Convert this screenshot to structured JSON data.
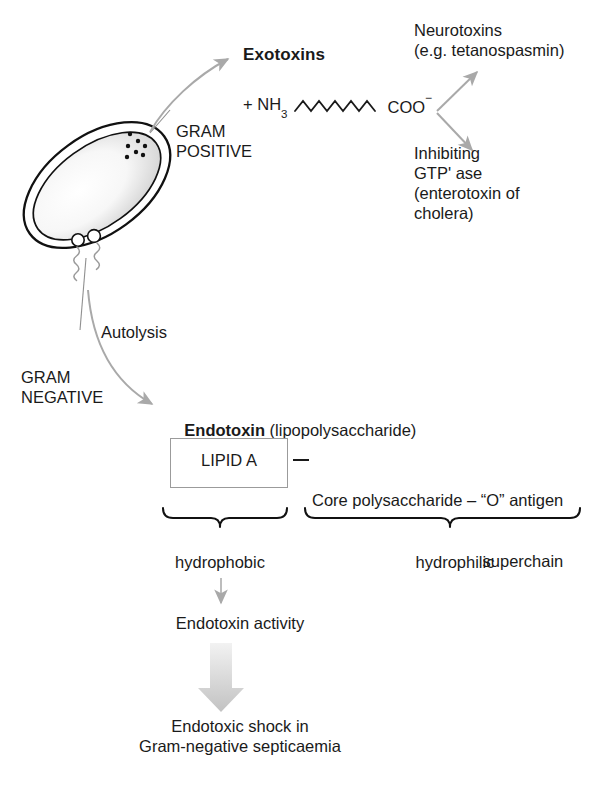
{
  "diagram": {
    "colors": {
      "arrow_gray": "#a9a9a9",
      "block_arrow_gray": "#cfcfcf",
      "outline_black": "#111111",
      "box_border": "#9b9b9b",
      "text": "#1a1a1a",
      "background": "#ffffff"
    },
    "cell": {
      "name": "bacterium",
      "granule_count": 7,
      "flagella_count": 2
    },
    "labels": {
      "exotoxins": "Exotoxins",
      "gram_positive": "GRAM\nPOSITIVE",
      "gram_negative": "GRAM\nNEGATIVE",
      "autolysis": "Autolysis",
      "neurotoxins": "Neurotoxins\n(e.g. tetanospasmin)",
      "inhibiting_gtpase": "Inhibiting\nGTP' ase\n(enterotoxin of\ncholera)",
      "endotoxin_bold": "Endotoxin",
      "endotoxin_paren": " (lipopolysaccharide)",
      "lipid_a": "LIPID A",
      "core_polysaccharide": "Core polysaccharide – “O” antigen",
      "superchain": "superchain",
      "hydrophobic": "hydrophobic",
      "hydrophilic": "hydrophilic",
      "endotoxin_activity": "Endotoxin activity",
      "endotoxic_shock": "Endotoxic shock in\nGram-negative septicaemia"
    },
    "peptide_chain": {
      "n_terminus_plus": "+",
      "n_terminus": "NH",
      "n_terminus_sub": "3",
      "c_terminus": "COO",
      "c_terminus_sup": "−",
      "zigzag_peaks": 5
    },
    "connector_dash": "—"
  }
}
